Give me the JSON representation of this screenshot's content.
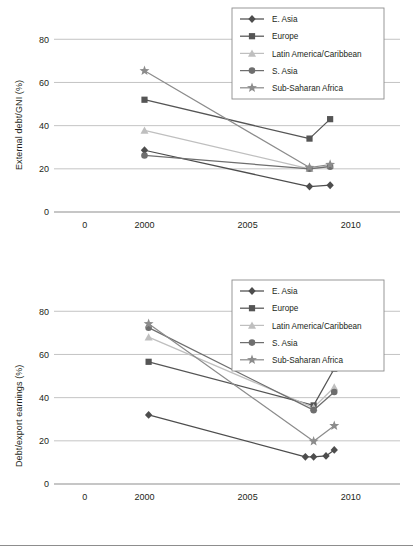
{
  "figure": {
    "y_axis_label_top": "External debt/GNI (%)",
    "y_axis_label_bottom": "Debt/export earnings (%)"
  },
  "colors": {
    "e_asia": "#4d4d4d",
    "europe": "#555555",
    "latin_america": "#bfbfbf",
    "s_asia": "#6e6e6e",
    "sub_saharan": "#8c8c8c",
    "grid": "#b5b5b5",
    "axis": "#8d8d8d",
    "text": "#231f20",
    "legend_border": "#8d8d8d"
  },
  "legend": {
    "position": "top-right",
    "entries": [
      {
        "label": "E. Asia",
        "marker": "diamond",
        "color": "#4d4d4d"
      },
      {
        "label": "Europe",
        "marker": "square",
        "color": "#555555"
      },
      {
        "label": "Latin America/Caribbean",
        "marker": "triangle",
        "color": "#bfbfbf"
      },
      {
        "label": "S. Asia",
        "marker": "circle",
        "color": "#6e6e6e"
      },
      {
        "label": "Sub-Saharan Africa",
        "marker": "star",
        "color": "#8c8c8c"
      }
    ]
  },
  "chart_data": [
    {
      "type": "line",
      "id": "external-debt-gni",
      "title": "",
      "xlabel": "",
      "ylabel": "External debt/GNI (%)",
      "xlim": [
        1996,
        2012
      ],
      "ylim": [
        0,
        88
      ],
      "xticks": [
        0,
        2000,
        2005,
        2010
      ],
      "xtick_labels": [
        "0",
        "2000",
        "2005",
        "2010"
      ],
      "yticks": [
        0,
        20,
        40,
        60,
        80
      ],
      "ytick_labels": [
        "0",
        "20",
        "40",
        "60",
        "80"
      ],
      "grid": "horizontal",
      "legend_position": "top-right",
      "series": [
        {
          "name": "E. Asia",
          "marker": "diamond",
          "color": "#4d4d4d",
          "x": [
            2000,
            2008,
            2009
          ],
          "values": [
            28.6,
            11.8,
            12.4
          ]
        },
        {
          "name": "Europe",
          "marker": "square",
          "color": "#555555",
          "x": [
            2000,
            2008,
            2009
          ],
          "values": [
            52.0,
            34.0,
            43.0
          ]
        },
        {
          "name": "Latin America/Caribbean",
          "marker": "triangle",
          "color": "#bfbfbf",
          "x": [
            2000,
            2008,
            2009
          ],
          "values": [
            37.8,
            20.0,
            21.4
          ]
        },
        {
          "name": "S. Asia",
          "marker": "circle",
          "color": "#6e6e6e",
          "x": [
            2000,
            2008,
            2009
          ],
          "values": [
            26.2,
            20.0,
            21.0
          ]
        },
        {
          "name": "Sub-Saharan Africa",
          "marker": "star",
          "color": "#8c8c8c",
          "x": [
            2000,
            2008,
            2009
          ],
          "values": [
            65.4,
            20.6,
            22.0
          ]
        }
      ]
    },
    {
      "type": "line",
      "id": "debt-export-earnings",
      "title": "",
      "xlabel": "",
      "ylabel": "Debt/export earnings (%)",
      "xlim": [
        1996,
        2012
      ],
      "ylim": [
        0,
        88
      ],
      "xticks": [
        0,
        2000,
        2005,
        2010
      ],
      "xtick_labels": [
        "0",
        "2000",
        "2005",
        "2010"
      ],
      "yticks": [
        0,
        20,
        40,
        60,
        80
      ],
      "ytick_labels": [
        "0",
        "20",
        "40",
        "60",
        "80"
      ],
      "grid": "horizontal",
      "legend_position": "top-right",
      "series": [
        {
          "name": "E. Asia",
          "marker": "diamond",
          "color": "#4d4d4d",
          "x": [
            2000.2,
            2007.8,
            2008.2,
            2008.8,
            2009.2
          ],
          "values": [
            32.0,
            12.6,
            12.6,
            13.0,
            15.8
          ]
        },
        {
          "name": "Europe",
          "marker": "square",
          "color": "#555555",
          "x": [
            2000.2,
            2008.2,
            2009.2
          ],
          "values": [
            56.6,
            36.4,
            53.4
          ]
        },
        {
          "name": "Latin America/Caribbean",
          "marker": "triangle",
          "color": "#bfbfbf",
          "x": [
            2000.2,
            2008.2,
            2009.2
          ],
          "values": [
            68.0,
            35.4,
            44.8
          ]
        },
        {
          "name": "S. Asia",
          "marker": "circle",
          "color": "#6e6e6e",
          "x": [
            2000.2,
            2008.2,
            2009.2
          ],
          "values": [
            72.4,
            34.2,
            42.6
          ]
        },
        {
          "name": "Sub-Saharan Africa",
          "marker": "star",
          "color": "#8c8c8c",
          "x": [
            2000.2,
            2008.2,
            2009.2
          ],
          "values": [
            74.2,
            19.8,
            27.0
          ]
        }
      ]
    }
  ]
}
